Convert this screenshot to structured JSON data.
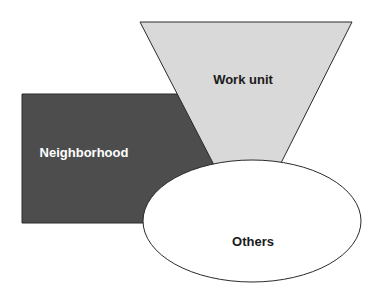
{
  "diagram": {
    "type": "overlapping-shapes",
    "shapes": [
      {
        "id": "neighborhood",
        "shape": "rectangle",
        "label": "Neighborhood",
        "fill": "#4d4d4d",
        "stroke": "#2a2a2a",
        "text_color": "#ffffff"
      },
      {
        "id": "work-unit",
        "shape": "inverted-trapezoid",
        "label": "Work unit",
        "fill": "#d9d9d9",
        "stroke": "#2a2a2a",
        "text_color": "#1a1a1a"
      },
      {
        "id": "others",
        "shape": "ellipse",
        "label": "Others",
        "fill": "#ffffff",
        "stroke": "#2a2a2a",
        "text_color": "#1a1a1a"
      }
    ]
  },
  "labels": {
    "neighborhood": "Neighborhood",
    "work_unit": "Work unit",
    "others": "Others"
  }
}
